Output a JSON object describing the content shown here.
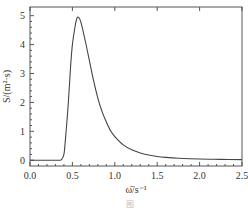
{
  "chart_data": {
    "type": "line",
    "title": "",
    "xlabel": "ω̄/s⁻¹",
    "ylabel": "S/(m²·s)",
    "xlim": [
      0.0,
      2.5
    ],
    "ylim": [
      -0.2,
      5.3
    ],
    "xticks": [
      0.0,
      0.5,
      1.0,
      1.5,
      2.0,
      2.5
    ],
    "xtick_labels": [
      "0.0",
      "0.5",
      "1.0",
      "1.5",
      "2.0",
      "2.5"
    ],
    "yticks": [
      0,
      1,
      2,
      3,
      4,
      5
    ],
    "ytick_labels": [
      "0",
      "1",
      "2",
      "3",
      "4",
      "5"
    ],
    "grid": false,
    "legend": "none",
    "series": [
      {
        "name": "S(ω)",
        "x": [
          0.0,
          0.1,
          0.2,
          0.3,
          0.35,
          0.37,
          0.4,
          0.42,
          0.45,
          0.48,
          0.5,
          0.53,
          0.55,
          0.57,
          0.6,
          0.65,
          0.7,
          0.75,
          0.8,
          0.85,
          0.9,
          0.95,
          1.0,
          1.1,
          1.2,
          1.3,
          1.4,
          1.5,
          1.6,
          1.75,
          2.0,
          2.25,
          2.5
        ],
        "y": [
          0,
          0,
          0,
          0,
          0,
          0.02,
          0.2,
          0.8,
          1.9,
          3.3,
          4.0,
          4.6,
          4.88,
          4.95,
          4.78,
          4.15,
          3.45,
          2.75,
          2.15,
          1.68,
          1.32,
          1.02,
          0.82,
          0.53,
          0.36,
          0.25,
          0.18,
          0.13,
          0.1,
          0.07,
          0.04,
          0.03,
          0.02
        ]
      }
    ]
  },
  "caption": "图"
}
